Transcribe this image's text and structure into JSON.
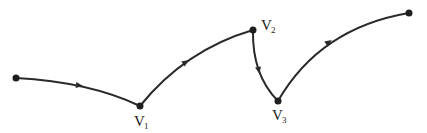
{
  "diagram": {
    "type": "directed-path",
    "colors": {
      "stroke": "#2a2a2a",
      "vertex": "#1e1e1e",
      "background": "#ffffff"
    },
    "vertices": [
      {
        "id": "start",
        "x": 16,
        "y": 78,
        "label": "",
        "sub": ""
      },
      {
        "id": "V1",
        "x": 140,
        "y": 106,
        "label": "V",
        "sub": "1"
      },
      {
        "id": "V2",
        "x": 253,
        "y": 30,
        "label": "V",
        "sub": "2"
      },
      {
        "id": "V3",
        "x": 278,
        "y": 101,
        "label": "V",
        "sub": "3"
      },
      {
        "id": "end",
        "x": 409,
        "y": 13,
        "label": "",
        "sub": ""
      }
    ],
    "edges": [
      {
        "from": "start",
        "to": "V1",
        "direction": "forward"
      },
      {
        "from": "V1",
        "to": "V2",
        "direction": "forward"
      },
      {
        "from": "V2",
        "to": "V3",
        "direction": "forward"
      },
      {
        "from": "V3",
        "to": "end",
        "direction": "forward"
      }
    ],
    "labels": {
      "v1": {
        "main": "V",
        "sub": "1"
      },
      "v2": {
        "main": "V",
        "sub": "2"
      },
      "v3": {
        "main": "V",
        "sub": "3"
      }
    }
  }
}
